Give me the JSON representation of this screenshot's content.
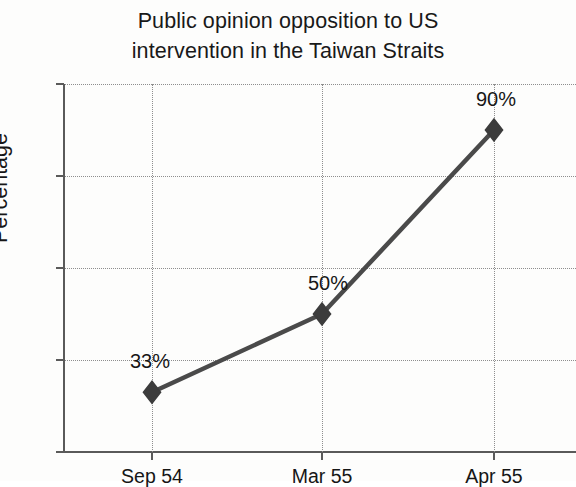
{
  "chart_data": {
    "type": "line",
    "title": "Public opinion opposition to US intervention in the Taiwan Straits",
    "title_lines": [
      "Public opinion opposition to US",
      "intervention in the Taiwan Straits"
    ],
    "categories": [
      "Sep 54",
      "Mar 55",
      "Apr 55"
    ],
    "values": [
      33,
      50,
      90
    ],
    "point_labels": [
      "33%",
      "50%",
      "90%"
    ],
    "xlabel": "",
    "ylabel": "Percentage",
    "ylim": [
      20,
      100
    ],
    "ytick_labels": [
      "100",
      "80",
      "60",
      "40",
      "20"
    ],
    "ytick_values": [
      100,
      80,
      60,
      40,
      20
    ],
    "grid": true,
    "grid_style": "dotted",
    "legend": false,
    "legend_position": "none",
    "series": [
      {
        "name": "Percentage opposed",
        "values": [
          33,
          50,
          90
        ],
        "marker": "diamond",
        "color": "#4a4a4a"
      }
    ],
    "colors": {
      "line": "#4a4a4a",
      "marker": "#3c3c3c",
      "axis": "#5a5a5a",
      "grid": "#8e8e8e",
      "text": "#161616",
      "background": "#fdfdfc"
    }
  }
}
